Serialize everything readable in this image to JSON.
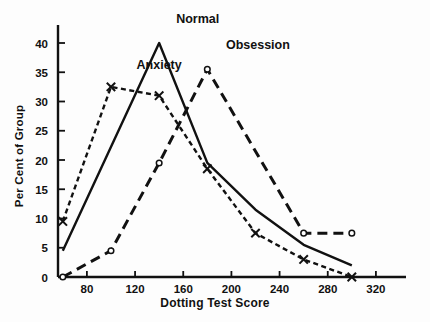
{
  "chart_data": {
    "type": "line",
    "title": "",
    "xlabel": "Dotting Test Score",
    "ylabel": "Per Cent of Group",
    "xlim": [
      56,
      340
    ],
    "ylim": [
      0,
      42
    ],
    "xticks": [
      80,
      120,
      160,
      200,
      240,
      280,
      320
    ],
    "yticks": [
      0,
      5,
      10,
      15,
      20,
      25,
      30,
      35,
      40
    ],
    "grid": false,
    "legend": "inline-annotations",
    "series": [
      {
        "name": "Anxiety",
        "style": "short-dashed",
        "marker": "x",
        "color": "#111111",
        "x": [
          60,
          100,
          140,
          180,
          220,
          260,
          300
        ],
        "values": [
          9.5,
          32.5,
          31.0,
          18.5,
          7.5,
          3.0,
          0.0
        ],
        "label_x": 140,
        "label_y": 35.5
      },
      {
        "name": "Normal",
        "style": "solid",
        "marker": "none",
        "color": "#111111",
        "x": [
          60,
          140,
          180,
          220,
          260,
          300
        ],
        "values": [
          4.5,
          40.0,
          19.5,
          11.5,
          5.5,
          2.0
        ],
        "label_x": 172,
        "label_y": 43.5
      },
      {
        "name": "Obsession",
        "style": "long-dashed",
        "marker": "o",
        "color": "#111111",
        "x": [
          60,
          100,
          140,
          180,
          260,
          300
        ],
        "values": [
          0.0,
          4.5,
          19.5,
          35.5,
          7.5,
          7.5
        ],
        "label_x": 222,
        "label_y": 39.0
      }
    ],
    "tick_labels_x": [
      "80",
      "120",
      "160",
      "200",
      "240",
      "280",
      "320"
    ],
    "tick_labels_y": [
      "0",
      "5",
      "10",
      "15",
      "20",
      "25",
      "30",
      "35",
      "40"
    ]
  }
}
